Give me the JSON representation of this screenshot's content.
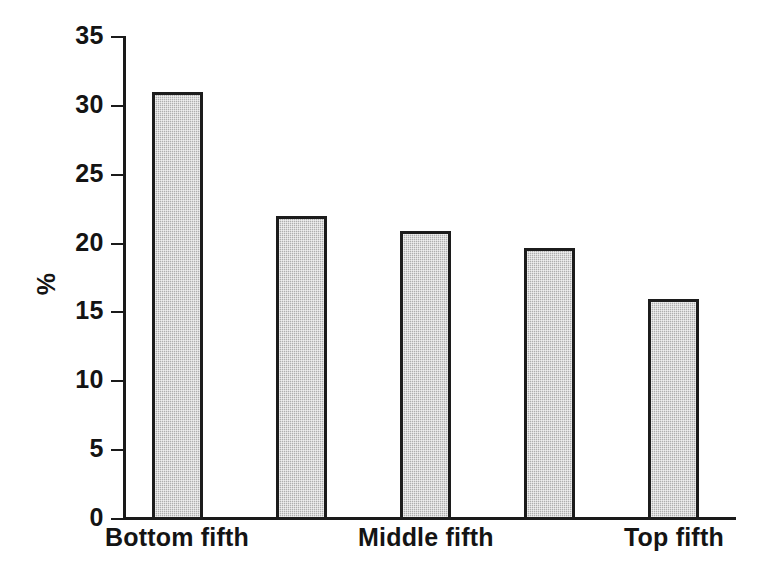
{
  "chart_data": {
    "type": "bar",
    "title": "",
    "subtitle": "",
    "xlabel": "",
    "ylabel": "%",
    "categories": [
      "Bottom fifth",
      "",
      "Middle fifth",
      "",
      "Top fifth"
    ],
    "values": [
      31.0,
      22.0,
      20.9,
      19.7,
      16.0
    ],
    "ylim": [
      0,
      35
    ],
    "yticks": [
      0,
      5,
      10,
      15,
      20,
      25,
      30,
      35
    ],
    "ytick_labels": [
      "0",
      "5",
      "10",
      "15",
      "20",
      "25",
      "30",
      "35"
    ],
    "visible_xtick_labels": [
      "Bottom fifth",
      "Middle fifth",
      "Top fifth"
    ],
    "grid": false,
    "legend": null,
    "series": [
      {
        "name": "share",
        "values": [
          31.0,
          22.0,
          20.9,
          19.7,
          16.0
        ]
      }
    ],
    "colors": {
      "bar_fill": "#b9b9b9",
      "bar_border": "#1c1c1c",
      "axis": "#1a1a1a",
      "text": "#141414",
      "background": "#ffffff"
    }
  },
  "axis": {
    "y_title": "%",
    "ticks": [
      {
        "label": "35",
        "value": 35
      },
      {
        "label": "30",
        "value": 30
      },
      {
        "label": "25",
        "value": 25
      },
      {
        "label": "20",
        "value": 20
      },
      {
        "label": "15",
        "value": 15
      },
      {
        "label": "10",
        "value": 10
      },
      {
        "label": "5",
        "value": 5
      },
      {
        "label": "0",
        "value": 0
      }
    ]
  },
  "bars": [
    {
      "label": "Bottom fifth",
      "value": 31.0,
      "show_label": true
    },
    {
      "label": "",
      "value": 22.0,
      "show_label": false
    },
    {
      "label": "Middle fifth",
      "value": 20.9,
      "show_label": true
    },
    {
      "label": "",
      "value": 19.7,
      "show_label": false
    },
    {
      "label": "Top fifth",
      "value": 16.0,
      "show_label": true
    }
  ]
}
